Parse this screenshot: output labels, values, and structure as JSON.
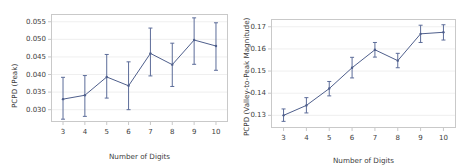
{
  "figure": {
    "background": "#ffffff",
    "line_color": "#4f5f8c",
    "grid_color": "#e8e8e8",
    "axis_color": "#c9c9c9"
  },
  "chart_data": [
    {
      "type": "line",
      "panel": "left",
      "title": "",
      "xlabel": "Number of Digits",
      "ylabel": "PCPD (Peak)",
      "grid": true,
      "legend": null,
      "x": [
        3,
        4,
        5,
        6,
        7,
        8,
        9,
        10
      ],
      "xticklabels": [
        "3",
        "4",
        "5",
        "6",
        "7",
        "8",
        "9",
        "10"
      ],
      "xlim": [
        2.45,
        10.55
      ],
      "ylim": [
        0.0265,
        0.0572
      ],
      "yticks": [
        0.03,
        0.035,
        0.04,
        0.045,
        0.05,
        0.055
      ],
      "yticklabels": [
        "0.030",
        "0.035",
        "0.040",
        "0.045",
        "0.050",
        "0.055"
      ],
      "values": [
        0.033,
        0.0341,
        0.0393,
        0.0368,
        0.046,
        0.0428,
        0.0498,
        0.0481
      ],
      "err_low": [
        0.0273,
        0.0281,
        0.0333,
        0.03,
        0.0396,
        0.0366,
        0.0429,
        0.0412
      ],
      "err_high": [
        0.0392,
        0.0397,
        0.0457,
        0.0436,
        0.0532,
        0.0489,
        0.0561,
        0.0547
      ]
    },
    {
      "type": "line",
      "panel": "right",
      "title": "",
      "xlabel": "Number of Digits",
      "ylabel": "PCPD (Valley-to-Peak Magnitude)",
      "grid": true,
      "legend": null,
      "x": [
        3,
        4,
        5,
        6,
        7,
        8,
        9,
        10
      ],
      "xticklabels": [
        "3",
        "4",
        "5",
        "6",
        "7",
        "8",
        "9",
        "10"
      ],
      "xlim": [
        2.45,
        10.55
      ],
      "ylim": [
        0.1243,
        0.1735
      ],
      "yticks": [
        0.13,
        0.14,
        0.15,
        0.16,
        0.17
      ],
      "yticklabels": [
        "0.13",
        "0.14",
        "0.15",
        "0.16",
        "0.17"
      ],
      "values": [
        0.13,
        0.1345,
        0.1421,
        0.1515,
        0.1596,
        0.1547,
        0.1668,
        0.1675
      ],
      "err_low": [
        0.1273,
        0.1311,
        0.1388,
        0.1469,
        0.1563,
        0.1515,
        0.1629,
        0.164
      ],
      "err_high": [
        0.1329,
        0.138,
        0.1453,
        0.1562,
        0.1629,
        0.158,
        0.1707,
        0.1709
      ]
    }
  ]
}
